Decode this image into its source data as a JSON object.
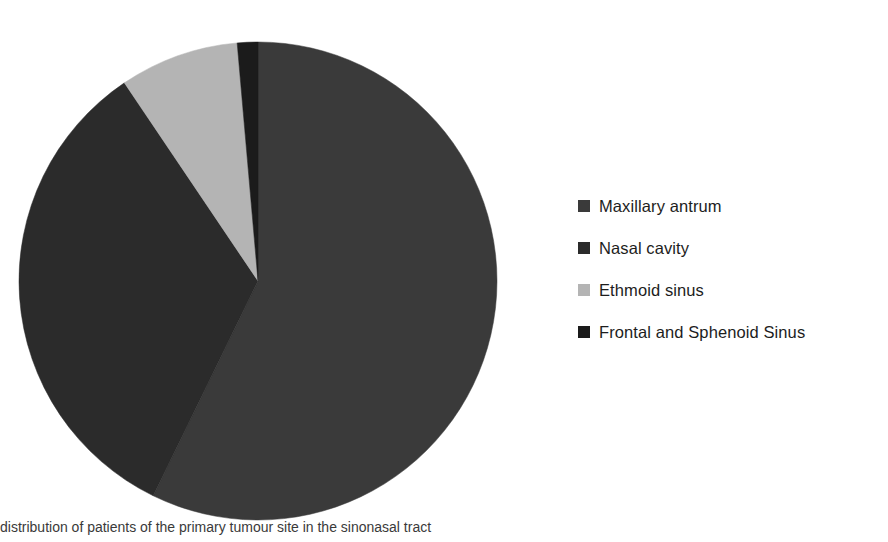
{
  "chart_data": {
    "type": "pie",
    "title": "",
    "subtitle": "",
    "xlabel": "",
    "ylabel": "",
    "legend_position": "right",
    "grid": false,
    "start_angle_deg": 0,
    "direction": "clockwise",
    "categories": [
      "Maxillary antrum",
      "Nasal cavity",
      "Ethmoid sinus",
      "Frontal and Sphenoid Sinus"
    ],
    "values": [
      57.2,
      33.3,
      8.1,
      1.4
    ],
    "unit": "percent",
    "colors": [
      "#3a3a3a",
      "#2b2b2b",
      "#b4b4b4",
      "#1b1b1b"
    ],
    "slices": [
      {
        "label": "Maxillary antrum",
        "value": 57.2,
        "color": "#3a3a3a",
        "start_deg": 0,
        "end_deg": 206
      },
      {
        "label": "Nasal cavity",
        "value": 33.3,
        "color": "#2b2b2b",
        "start_deg": 206,
        "end_deg": 326
      },
      {
        "label": "Ethmoid sinus",
        "value": 8.1,
        "color": "#b4b4b4",
        "start_deg": 326,
        "end_deg": 355
      },
      {
        "label": "Frontal and Sphenoid Sinus",
        "value": 1.4,
        "color": "#1b1b1b",
        "start_deg": 355,
        "end_deg": 360
      }
    ]
  },
  "legend": {
    "items": [
      {
        "label": "Maxillary antrum",
        "color": "#3a3a3a",
        "swatch_icon": "square-swatch-icon"
      },
      {
        "label": "Nasal cavity",
        "color": "#2b2b2b",
        "swatch_icon": "square-swatch-icon"
      },
      {
        "label": "Ethmoid sinus",
        "color": "#b4b4b4",
        "swatch_icon": "square-swatch-icon"
      },
      {
        "label": "Frontal and Sphenoid Sinus",
        "color": "#1b1b1b",
        "swatch_icon": "square-swatch-icon"
      }
    ]
  },
  "caption": {
    "text": "distribution of patients of the primary tumour site in the sinonasal tract"
  },
  "geometry": {
    "center_x": 258,
    "center_y": 281,
    "radius": 239
  }
}
